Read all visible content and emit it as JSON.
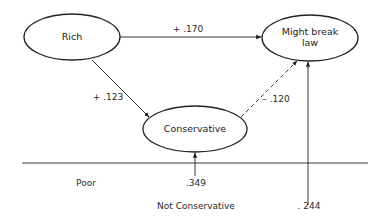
{
  "nodes": {
    "rich": {
      "label": "Rich"
    },
    "might_break_law": {
      "line1": "Might break",
      "line2": "law"
    },
    "conservative": {
      "label": "Conservative"
    }
  },
  "edges": {
    "rich_to_law": {
      "label": "+ .170",
      "style": "solid"
    },
    "rich_to_conservative": {
      "label": "+ .123",
      "style": "solid"
    },
    "conservative_to_law": {
      "label": "– .120",
      "style": "dashed"
    }
  },
  "bottom_labels": {
    "poor": "Poor",
    "conservative_residual": ".349",
    "not_conservative": "Not Conservative",
    "law_residual": ". 244"
  },
  "colors": {
    "stroke": "#222222",
    "text": "#2a2a2a",
    "background": "#ffffff"
  }
}
